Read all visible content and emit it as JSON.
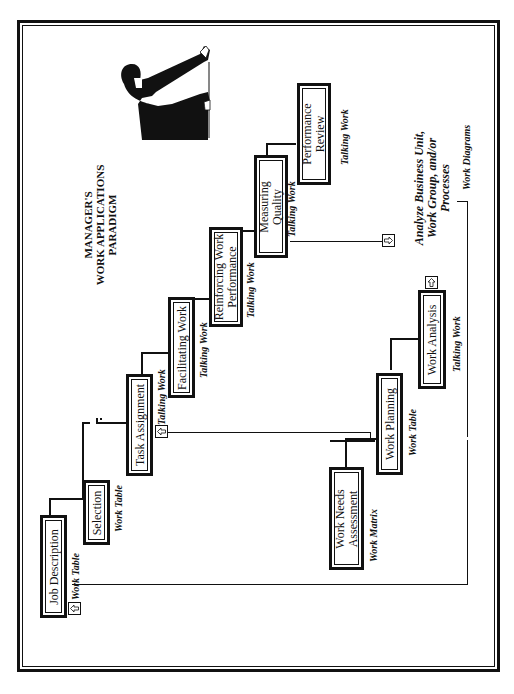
{
  "title": {
    "line1": "MANAGER'S",
    "line2": "WORK APPLICATIONS",
    "line3": "PARADIGM"
  },
  "upper_track": [
    {
      "id": "job-description",
      "label": "Job Description",
      "caption": "Work Table"
    },
    {
      "id": "selection",
      "label": "Selection",
      "caption": "Work Table"
    },
    {
      "id": "task-assignment",
      "label": "Task Assignment",
      "caption": "Talking Work"
    },
    {
      "id": "facilitating-work",
      "label": "Facilitating Work",
      "caption": "Talking Work"
    },
    {
      "id": "reinforcing-work-performance",
      "label_line1": "Reinforcing Work",
      "label_line2": "Performance",
      "caption": "Talking Work"
    },
    {
      "id": "measuring-quality",
      "label_line1": "Measuring",
      "label_line2": "Quality",
      "caption": "Talking Work"
    },
    {
      "id": "performance-review",
      "label_line1": "Performance",
      "label_line2": "Review",
      "caption": "Talking Work"
    }
  ],
  "lower_track": [
    {
      "id": "work-needs-assessment",
      "label_line1": "Work Needs",
      "label_line2": "Assessment",
      "caption": "Work Matrix"
    },
    {
      "id": "work-planning",
      "label": "Work Planning",
      "caption": "Work Table"
    },
    {
      "id": "work-analysis",
      "label": "Work Analysis",
      "caption": "Talking Work"
    }
  ],
  "side_note": {
    "line1": "Analyze Business Unit,",
    "line2": "Work Group, and/or",
    "line3": "Processes",
    "caption": "Work Diagrams"
  },
  "illustration": "manager-pointing-at-chart",
  "arrow_icon": "arrow-right-box-icon"
}
